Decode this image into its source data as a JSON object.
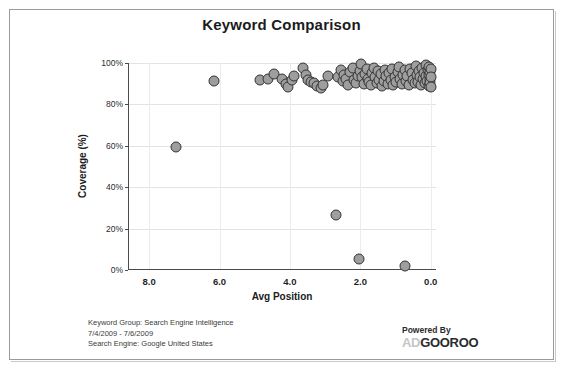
{
  "chart_data": {
    "type": "scatter",
    "title": "Keyword Comparison",
    "xlabel": "Avg Position",
    "ylabel": "Coverage (%)",
    "xlim": [
      8.6,
      -0.15
    ],
    "ylim": [
      0,
      100
    ],
    "x_ticks": [
      "8.0",
      "6.0",
      "4.0",
      "2.0",
      "0.0"
    ],
    "x_tick_values": [
      8.0,
      6.0,
      4.0,
      2.0,
      0.0
    ],
    "y_ticks": [
      "0%",
      "20%",
      "40%",
      "60%",
      "80%",
      "100%"
    ],
    "y_tick_values": [
      0,
      20,
      40,
      60,
      80,
      100
    ],
    "grid": true,
    "legend": "none",
    "x_axis_reversed": true,
    "marker": {
      "shape": "circle",
      "fill": "#9e9e9e",
      "edge": "#333333",
      "size": 11
    },
    "series": [
      {
        "name": "Keywords",
        "points": [
          [
            7.25,
            59.5
          ],
          [
            6.15,
            91.5
          ],
          [
            4.85,
            92.0
          ],
          [
            4.62,
            92.5
          ],
          [
            4.45,
            94.5
          ],
          [
            4.22,
            92.5
          ],
          [
            4.12,
            90.0
          ],
          [
            4.05,
            88.5
          ],
          [
            3.95,
            92.0
          ],
          [
            3.88,
            93.5
          ],
          [
            3.62,
            97.5
          ],
          [
            3.55,
            94.0
          ],
          [
            3.48,
            92.0
          ],
          [
            3.4,
            91.0
          ],
          [
            3.32,
            90.5
          ],
          [
            3.22,
            89.0
          ],
          [
            3.12,
            88.0
          ],
          [
            3.05,
            89.5
          ],
          [
            2.92,
            93.5
          ],
          [
            2.7,
            26.5
          ],
          [
            2.62,
            93.0
          ],
          [
            2.55,
            96.5
          ],
          [
            2.5,
            91.5
          ],
          [
            2.45,
            94.0
          ],
          [
            2.4,
            92.5
          ],
          [
            2.35,
            89.5
          ],
          [
            2.28,
            95.5
          ],
          [
            2.22,
            97.5
          ],
          [
            2.18,
            92.0
          ],
          [
            2.12,
            90.5
          ],
          [
            2.08,
            93.5
          ],
          [
            2.05,
            5.5
          ],
          [
            2.02,
            96.0
          ],
          [
            1.98,
            99.5
          ],
          [
            1.95,
            93.0
          ],
          [
            1.9,
            90.0
          ],
          [
            1.86,
            94.5
          ],
          [
            1.82,
            97.0
          ],
          [
            1.78,
            92.5
          ],
          [
            1.74,
            91.0
          ],
          [
            1.7,
            89.5
          ],
          [
            1.66,
            95.0
          ],
          [
            1.62,
            97.5
          ],
          [
            1.58,
            93.0
          ],
          [
            1.54,
            90.5
          ],
          [
            1.5,
            96.0
          ],
          [
            1.46,
            92.0
          ],
          [
            1.42,
            94.5
          ],
          [
            1.38,
            89.0
          ],
          [
            1.34,
            91.5
          ],
          [
            1.3,
            96.5
          ],
          [
            1.26,
            93.5
          ],
          [
            1.22,
            90.0
          ],
          [
            1.18,
            95.0
          ],
          [
            1.14,
            92.0
          ],
          [
            1.1,
            97.0
          ],
          [
            1.06,
            89.5
          ],
          [
            1.02,
            93.0
          ],
          [
            0.98,
            91.0
          ],
          [
            0.94,
            95.5
          ],
          [
            0.9,
            98.0
          ],
          [
            0.86,
            92.5
          ],
          [
            0.82,
            90.0
          ],
          [
            0.78,
            94.0
          ],
          [
            0.74,
            96.5
          ],
          [
            0.72,
            2.0
          ],
          [
            0.7,
            91.5
          ],
          [
            0.66,
            93.5
          ],
          [
            0.62,
            89.5
          ],
          [
            0.58,
            97.0
          ],
          [
            0.54,
            95.0
          ],
          [
            0.5,
            92.0
          ],
          [
            0.46,
            90.5
          ],
          [
            0.42,
            98.5
          ],
          [
            0.4,
            94.0
          ],
          [
            0.36,
            91.0
          ],
          [
            0.33,
            96.0
          ],
          [
            0.3,
            93.0
          ],
          [
            0.27,
            89.5
          ],
          [
            0.24,
            97.5
          ],
          [
            0.21,
            92.5
          ],
          [
            0.18,
            95.0
          ],
          [
            0.16,
            90.5
          ],
          [
            0.14,
            99.0
          ],
          [
            0.12,
            93.5
          ],
          [
            0.1,
            91.5
          ],
          [
            0.08,
            96.5
          ],
          [
            0.06,
            94.0
          ],
          [
            0.05,
            89.0
          ],
          [
            0.04,
            98.0
          ],
          [
            0.03,
            92.0
          ],
          [
            0.02,
            95.5
          ],
          [
            0.01,
            90.5
          ],
          [
            0.0,
            97.0
          ],
          [
            0.0,
            93.0
          ],
          [
            0.0,
            88.5
          ]
        ]
      }
    ]
  },
  "footer": {
    "lines": [
      "Keyword Group: Search Engine Intelligence",
      "7/4/2009 - 7/6/2009",
      "Search Engine: Google United States"
    ],
    "powered_by_label": "Powered By",
    "logo_prefix": "AD",
    "logo_suffix": "GOOROO"
  }
}
